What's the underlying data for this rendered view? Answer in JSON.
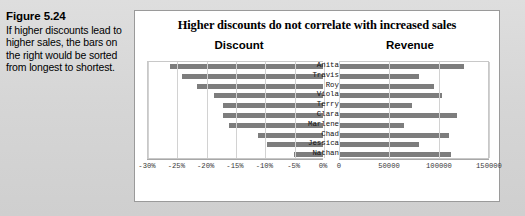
{
  "caption": {
    "title": "Figure 5.24",
    "body": "If higher discounts lead to higher sales, the bars on the right would be sorted from longest to shortest."
  },
  "chart_data": {
    "type": "bar",
    "orientation": "horizontal",
    "layout": "tornado-two-panel",
    "title": "Higher discounts do not  correlate with  increased sales",
    "categories": [
      "Anita",
      "Travis",
      "Roy",
      "Viola",
      "Terry",
      "Clara",
      "Marlene",
      "Chad",
      "Jessica",
      "Nathan"
    ],
    "panels": [
      {
        "name": "discount",
        "label": "Discount",
        "direction": "right-to-left",
        "values": [
          -0.26,
          -0.24,
          -0.215,
          -0.185,
          -0.17,
          -0.17,
          -0.16,
          -0.11,
          -0.095,
          -0.05
        ],
        "xlim": [
          -0.3,
          0.0
        ],
        "ticks": [
          "-30%",
          "-25%",
          "-20%",
          "-15%",
          "-10%",
          "-5%",
          "0%"
        ],
        "tickvalues": [
          -0.3,
          -0.25,
          -0.2,
          -0.15,
          -0.1,
          -0.05,
          0.0
        ],
        "sorted": true
      },
      {
        "name": "revenue",
        "label": "Revenue",
        "direction": "left-to-right",
        "values": [
          125000,
          80000,
          95000,
          103000,
          73000,
          118000,
          65000,
          110000,
          80000,
          112000
        ],
        "xlim": [
          0,
          150000
        ],
        "ticks": [
          "0",
          "50000",
          "100000",
          "150000"
        ],
        "tickvalues": [
          0,
          50000,
          100000,
          150000
        ],
        "sorted": false
      }
    ],
    "barcolor": "#7d7d7d",
    "gridcolor": "#d2d2d2",
    "grid": true,
    "legend": "none"
  }
}
